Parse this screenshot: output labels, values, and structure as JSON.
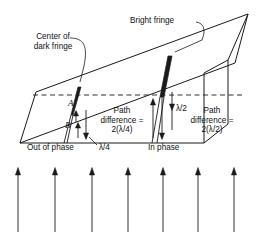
{
  "figure": {
    "name": "wedge-interference-diagram",
    "stroke_color": "#1a1a1a",
    "background": "#ffffff",
    "labels": {
      "center_of_dark_fringe_line1": "Center of",
      "center_of_dark_fringe_line2": "dark fringe",
      "bright_fringe": "Bright fringe",
      "point_a": "A",
      "point_b": "B",
      "path_diff_left_line1": "Path",
      "path_diff_left_line2": "difference =",
      "path_diff_left_line3": "2(λ/4)",
      "path_diff_right_line1": "Path",
      "path_diff_right_line2": "difference =",
      "path_diff_right_line3": "2(λ/2)",
      "lambda_quarter": "λ/4",
      "lambda_half": "λ/2",
      "out_of_phase": "Out of phase",
      "in_phase": "In phase"
    },
    "incident_rays": {
      "count": 7,
      "direction": "up",
      "x_positions": [
        18,
        55,
        92,
        128,
        163,
        198,
        234
      ],
      "y_top": 168,
      "y_bottom": 232
    },
    "geometry": {
      "left_tip": [
        20,
        143
      ],
      "top_apex": [
        248,
        14
      ],
      "dashed_line_y": 95,
      "fringe_1_x": 78,
      "fringe_2_x": 168
    }
  }
}
